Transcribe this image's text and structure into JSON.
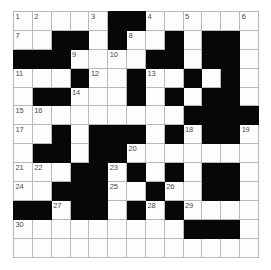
{
  "puzzle": {
    "title": "",
    "rows": 13,
    "cols": 13,
    "colors": {
      "block": "#070707",
      "cell": "#fdfdfd",
      "grid_line": "#b8b8b8",
      "number_text": "#4a4a4a",
      "page_background": "#ffffff"
    },
    "grid": [
      [
        "white",
        "white",
        "white",
        "white",
        "white",
        "block",
        "block",
        "white",
        "white",
        "white",
        "white",
        "white",
        "white"
      ],
      [
        "white",
        "white",
        "block",
        "block",
        "white",
        "block",
        "white",
        "white",
        "block",
        "white",
        "block",
        "block",
        "white"
      ],
      [
        "block",
        "block",
        "block",
        "white",
        "white",
        "white",
        "white",
        "block",
        "block",
        "white",
        "block",
        "block",
        "white"
      ],
      [
        "white",
        "white",
        "white",
        "block",
        "white",
        "white",
        "block",
        "white",
        "white",
        "block",
        "white",
        "block",
        "white"
      ],
      [
        "white",
        "block",
        "block",
        "white",
        "white",
        "white",
        "block",
        "white",
        "block",
        "white",
        "block",
        "block",
        "white"
      ],
      [
        "white",
        "white",
        "white",
        "white",
        "white",
        "white",
        "white",
        "white",
        "white",
        "block",
        "block",
        "block",
        "block"
      ],
      [
        "white",
        "white",
        "block",
        "white",
        "block",
        "block",
        "block",
        "white",
        "block",
        "white",
        "block",
        "block",
        "white"
      ],
      [
        "white",
        "block",
        "block",
        "white",
        "block",
        "block",
        "white",
        "white",
        "white",
        "white",
        "white",
        "white",
        "white"
      ],
      [
        "white",
        "white",
        "white",
        "block",
        "block",
        "white",
        "block",
        "white",
        "block",
        "white",
        "block",
        "block",
        "white"
      ],
      [
        "white",
        "white",
        "block",
        "block",
        "block",
        "white",
        "white",
        "block",
        "white",
        "white",
        "block",
        "block",
        "white"
      ],
      [
        "block",
        "block",
        "white",
        "block",
        "block",
        "white",
        "block",
        "white",
        "block",
        "white",
        "white",
        "white",
        "white"
      ],
      [
        "white",
        "white",
        "white",
        "white",
        "white",
        "white",
        "white",
        "white",
        "white",
        "block",
        "block",
        "block",
        "white"
      ],
      [
        "white",
        "white",
        "white",
        "white",
        "white",
        "white",
        "white",
        "white",
        "white",
        "white",
        "white",
        "white",
        "white"
      ]
    ],
    "numbers": [
      {
        "row": 0,
        "col": 0,
        "label": "1"
      },
      {
        "row": 0,
        "col": 1,
        "label": "2"
      },
      {
        "row": 0,
        "col": 4,
        "label": "3"
      },
      {
        "row": 0,
        "col": 7,
        "label": "4"
      },
      {
        "row": 0,
        "col": 9,
        "label": "5"
      },
      {
        "row": 0,
        "col": 12,
        "label": "6"
      },
      {
        "row": 1,
        "col": 0,
        "label": "7"
      },
      {
        "row": 1,
        "col": 6,
        "label": "8"
      },
      {
        "row": 2,
        "col": 3,
        "label": "9"
      },
      {
        "row": 2,
        "col": 5,
        "label": "10"
      },
      {
        "row": 3,
        "col": 0,
        "label": "11"
      },
      {
        "row": 3,
        "col": 4,
        "label": "12"
      },
      {
        "row": 3,
        "col": 7,
        "label": "13"
      },
      {
        "row": 4,
        "col": 3,
        "label": "14"
      },
      {
        "row": 5,
        "col": 0,
        "label": "15"
      },
      {
        "row": 5,
        "col": 1,
        "label": "16"
      },
      {
        "row": 6,
        "col": 0,
        "label": "17"
      },
      {
        "row": 6,
        "col": 9,
        "label": "18"
      },
      {
        "row": 6,
        "col": 12,
        "label": "19"
      },
      {
        "row": 7,
        "col": 6,
        "label": "20"
      },
      {
        "row": 8,
        "col": 0,
        "label": "21"
      },
      {
        "row": 8,
        "col": 1,
        "label": "22"
      },
      {
        "row": 8,
        "col": 5,
        "label": "23"
      },
      {
        "row": 9,
        "col": 0,
        "label": "24"
      },
      {
        "row": 9,
        "col": 5,
        "label": "25"
      },
      {
        "row": 9,
        "col": 8,
        "label": "26"
      },
      {
        "row": 10,
        "col": 2,
        "label": "27"
      },
      {
        "row": 10,
        "col": 7,
        "label": "28"
      },
      {
        "row": 10,
        "col": 9,
        "label": "29"
      },
      {
        "row": 11,
        "col": 0,
        "label": "30"
      }
    ],
    "letters": []
  }
}
